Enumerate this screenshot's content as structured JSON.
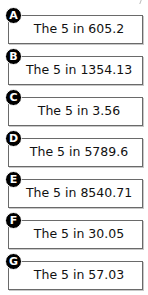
{
  "items": [
    {
      "label": "A",
      "text": "The 5 in 605.2"
    },
    {
      "label": "B",
      "text": "The 5 in 1354.13"
    },
    {
      "label": "C",
      "text": "The 5 in 3.56"
    },
    {
      "label": "D",
      "text": "The 5 in 5789.6"
    },
    {
      "label": "E",
      "text": "The 5 in 8540.71"
    },
    {
      "label": "F",
      "text": "The 5 in 30.05"
    },
    {
      "label": "G",
      "text": "The 5 in 57.03"
    }
  ]
}
